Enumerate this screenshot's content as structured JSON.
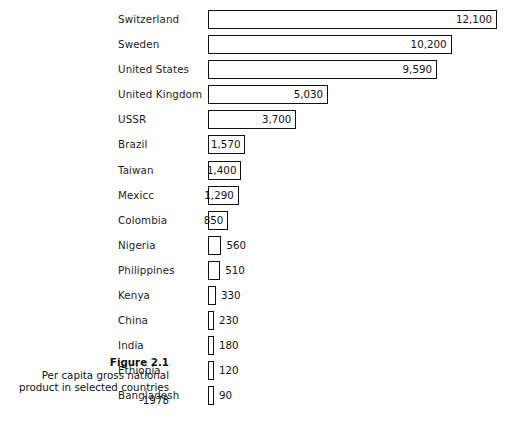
{
  "figure": {
    "caption_title": "Figure 2.1",
    "caption_body": "Per capita gross national product in selected countries 1978"
  },
  "chart_data": {
    "type": "bar",
    "orientation": "horizontal",
    "title": "Figure 2.1",
    "subtitle": "Per capita gross national product in selected countries 1978",
    "xlabel": "",
    "ylabel": "",
    "xlim": [
      0,
      12100
    ],
    "grid": false,
    "legend": false,
    "bar_style": "outlined-white",
    "categories": [
      "Switzerland",
      "Sweden",
      "United States",
      "United Kingdom",
      "USSR",
      "Brazil",
      "Taiwan",
      "Mexicc",
      "Colombia",
      "Nigeria",
      "Philippines",
      "Kenya",
      "China",
      "India",
      "Ethiopia",
      "Bangladesh"
    ],
    "values": [
      12100,
      10200,
      9590,
      5030,
      3700,
      1570,
      1400,
      1290,
      850,
      560,
      510,
      330,
      230,
      180,
      120,
      90
    ],
    "value_labels": [
      "12,100",
      "10,200",
      "9,590",
      "5,030",
      "3,700",
      "1,570",
      "1,400",
      "1,290",
      "850",
      "560",
      "510",
      "330",
      "230",
      "180",
      "120",
      "90"
    ],
    "label_placement": [
      "inside",
      "inside",
      "inside",
      "inside",
      "inside",
      "inside",
      "inside",
      "inside",
      "inside",
      "outside",
      "outside",
      "outside",
      "outside",
      "outside",
      "outside",
      "outside"
    ]
  },
  "style": {
    "bar_outline_color": "#111111",
    "bar_fill_color": "#ffffff",
    "text_color": "#1c1c1c",
    "background_color": "#ffffff"
  }
}
